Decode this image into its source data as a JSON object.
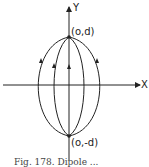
{
  "figure": {
    "axes": {
      "x_label": "X",
      "y_label": "Y"
    },
    "points": {
      "top": "(o,d)",
      "bottom": "(o,-d)"
    },
    "caption": "Fig. 178.    Dipole ..."
  },
  "colors": {
    "ink": "#222222",
    "background": "#ffffff"
  }
}
